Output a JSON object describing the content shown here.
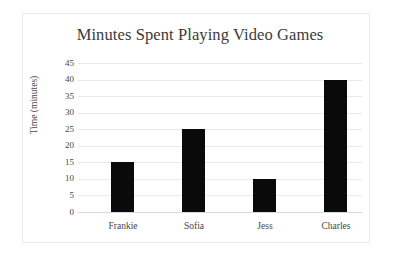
{
  "chart_data": {
    "type": "bar",
    "title": "Minutes Spent Playing Video Games",
    "xlabel": "",
    "ylabel": "Time (minutes)",
    "categories": [
      "Frankie",
      "Sofia",
      "Jess",
      "Charles"
    ],
    "values": [
      15,
      25,
      10,
      40
    ],
    "ylim": [
      0,
      45
    ],
    "ytick_labels": [
      "45",
      "40",
      "35",
      "30",
      "25",
      "20",
      "15",
      "10",
      "5",
      "0"
    ],
    "ytick_values": [
      45,
      40,
      35,
      30,
      25,
      20,
      15,
      10,
      5,
      0
    ],
    "ytick_step": 5,
    "grid": "horizontal",
    "legend": "none",
    "bar_color": "#0a0a0a",
    "gridline_color": "#e9e9ea",
    "title_color": "#3b3b3b",
    "axis_text_color": "#454545",
    "background": "#ffffff",
    "frame_border_color": "#ececed"
  }
}
